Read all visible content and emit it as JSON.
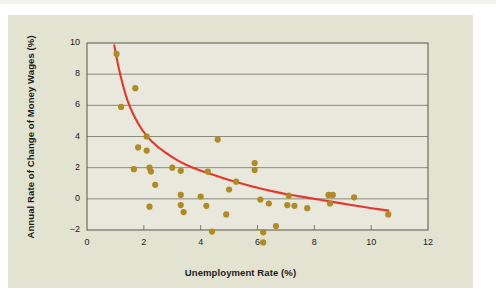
{
  "chart_data": {
    "type": "scatter",
    "title": "",
    "xlabel": "Unemployment Rate (%)",
    "ylabel": "Annual Rate of Change of Money Wages (%)",
    "xlim": [
      0,
      12
    ],
    "ylim": [
      -2,
      10
    ],
    "xticks": [
      0,
      2,
      4,
      6,
      8,
      10,
      12
    ],
    "yticks": [
      -2,
      0,
      2,
      4,
      6,
      8,
      10
    ],
    "grid": "horizontal",
    "legend": "none",
    "series": [
      {
        "name": "observations",
        "type": "scatter",
        "color": "#b08a22",
        "marker": "circle",
        "points": [
          [
            1.04,
            9.3
          ],
          [
            1.7,
            7.1
          ],
          [
            1.2,
            5.9
          ],
          [
            2.1,
            4.0
          ],
          [
            4.6,
            3.8
          ],
          [
            1.8,
            3.3
          ],
          [
            2.1,
            3.1
          ],
          [
            1.65,
            1.9
          ],
          [
            2.2,
            2.0
          ],
          [
            2.25,
            1.75
          ],
          [
            3.0,
            2.0
          ],
          [
            3.3,
            1.8
          ],
          [
            4.25,
            1.75
          ],
          [
            5.9,
            2.3
          ],
          [
            5.9,
            1.85
          ],
          [
            5.25,
            1.1
          ],
          [
            5.0,
            0.6
          ],
          [
            2.4,
            0.9
          ],
          [
            3.3,
            0.25
          ],
          [
            4.0,
            0.15
          ],
          [
            6.1,
            -0.05
          ],
          [
            7.1,
            0.2
          ],
          [
            8.5,
            0.25
          ],
          [
            8.65,
            0.25
          ],
          [
            9.4,
            0.1
          ],
          [
            2.2,
            -0.5
          ],
          [
            3.3,
            -0.4
          ],
          [
            3.4,
            -0.85
          ],
          [
            4.2,
            -0.45
          ],
          [
            6.4,
            -0.3
          ],
          [
            7.05,
            -0.4
          ],
          [
            7.3,
            -0.45
          ],
          [
            7.75,
            -0.6
          ],
          [
            8.55,
            -0.3
          ],
          [
            4.9,
            -1.0
          ],
          [
            10.6,
            -1.0
          ],
          [
            6.65,
            -1.75
          ],
          [
            4.4,
            -2.1
          ],
          [
            6.2,
            -2.15
          ],
          [
            6.2,
            -2.8
          ]
        ]
      },
      {
        "name": "fitted-phillips-curve",
        "type": "line",
        "color": "#e8342a",
        "curve": [
          [
            0.96,
            9.85
          ],
          [
            1.1,
            8.5
          ],
          [
            1.3,
            7.0
          ],
          [
            1.5,
            5.9
          ],
          [
            1.8,
            4.8
          ],
          [
            2.1,
            4.0
          ],
          [
            2.5,
            3.3
          ],
          [
            3.0,
            2.65
          ],
          [
            3.5,
            2.15
          ],
          [
            4.0,
            1.8
          ],
          [
            4.5,
            1.5
          ],
          [
            5.0,
            1.2
          ],
          [
            5.5,
            0.95
          ],
          [
            6.0,
            0.7
          ],
          [
            6.5,
            0.5
          ],
          [
            7.0,
            0.3
          ],
          [
            7.5,
            0.15
          ],
          [
            8.0,
            0.0
          ],
          [
            8.5,
            -0.15
          ],
          [
            9.0,
            -0.3
          ],
          [
            9.5,
            -0.45
          ],
          [
            10.0,
            -0.6
          ],
          [
            10.6,
            -0.75
          ]
        ]
      }
    ],
    "colors": {
      "point": "#b08a22",
      "curve": "#e8342a",
      "plot_background": "#e8e8dc",
      "card_background": "#e2e3d1",
      "frame": "#6e6f5e",
      "gridline": "#7f8070",
      "text": "#1b1b1b"
    }
  },
  "axes": {
    "x_tick_labels": [
      "0",
      "2",
      "4",
      "6",
      "8",
      "10",
      "12"
    ],
    "y_tick_labels": [
      "10",
      "8",
      "6",
      "4",
      "2",
      "0",
      "−2"
    ],
    "x_title": "Unemployment Rate (%)",
    "y_title": "Annual Rate of Change of Money Wages (%)"
  }
}
